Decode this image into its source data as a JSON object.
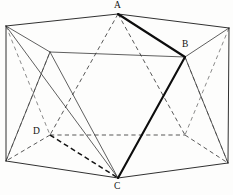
{
  "figure": {
    "canvas": {
      "width": 233,
      "height": 195
    },
    "colors": {
      "background": "#fdfdfc",
      "visible_edge": "#1a1a1a",
      "hidden_edge": "#3a3a3a",
      "highlight_edge": "#0d0d0d",
      "label_text": "#111111"
    },
    "labels": [
      {
        "id": "A",
        "text": "A",
        "x": 114,
        "y": 1
      },
      {
        "id": "B",
        "text": "B",
        "x": 182,
        "y": 40
      },
      {
        "id": "C",
        "text": "C",
        "x": 114,
        "y": 182
      },
      {
        "id": "D",
        "text": "D",
        "x": 33,
        "y": 127
      }
    ],
    "vertices": {
      "A": {
        "x": 118,
        "y": 14
      },
      "TL": {
        "x": 6,
        "y": 26
      },
      "TR": {
        "x": 229,
        "y": 28
      },
      "UL": {
        "x": 50,
        "y": 52
      },
      "B": {
        "x": 185,
        "y": 57
      },
      "UM": {
        "x": 118,
        "y": 14
      },
      "ML": {
        "x": 6,
        "y": 26
      },
      "D": {
        "x": 50,
        "y": 135
      },
      "LR": {
        "x": 185,
        "y": 135
      },
      "BL": {
        "x": 6,
        "y": 161
      },
      "BR": {
        "x": 228,
        "y": 163
      },
      "C": {
        "x": 118,
        "y": 178
      }
    },
    "edges_visible": [
      {
        "name": "A-TL",
        "x1": 118,
        "y1": 14,
        "x2": 6,
        "y2": 26
      },
      {
        "name": "A-TR",
        "x1": 118,
        "y1": 14,
        "x2": 229,
        "y2": 28
      },
      {
        "name": "TL-UL",
        "x1": 6,
        "y1": 26,
        "x2": 50,
        "y2": 52
      },
      {
        "name": "TR-B",
        "x1": 229,
        "y1": 28,
        "x2": 185,
        "y2": 57
      },
      {
        "name": "UL-B",
        "x1": 50,
        "y1": 52,
        "x2": 185,
        "y2": 57
      },
      {
        "name": "TL-BL",
        "x1": 6,
        "y1": 26,
        "x2": 6,
        "y2": 161
      },
      {
        "name": "TR-BR",
        "x1": 229,
        "y1": 28,
        "x2": 228,
        "y2": 163
      },
      {
        "name": "TL-C-ray",
        "x1": 6,
        "y1": 26,
        "x2": 118,
        "y2": 178
      },
      {
        "name": "UL-C",
        "x1": 50,
        "y1": 52,
        "x2": 118,
        "y2": 178
      },
      {
        "name": "UL-BL",
        "x1": 50,
        "y1": 52,
        "x2": 6,
        "y2": 161
      },
      {
        "name": "BL-C",
        "x1": 6,
        "y1": 161,
        "x2": 118,
        "y2": 178
      },
      {
        "name": "BR-C",
        "x1": 228,
        "y1": 163,
        "x2": 118,
        "y2": 178
      },
      {
        "name": "B-BR",
        "x1": 185,
        "y1": 57,
        "x2": 228,
        "y2": 163
      },
      {
        "name": "TR-Cx",
        "x1": 229,
        "y1": 28,
        "x2": 185,
        "y2": 135
      }
    ],
    "edges_bold": [
      {
        "name": "A-B",
        "x1": 118,
        "y1": 14,
        "x2": 185,
        "y2": 57
      },
      {
        "name": "B-C",
        "x1": 185,
        "y1": 57,
        "x2": 118,
        "y2": 178
      }
    ],
    "edges_hidden": [
      {
        "name": "A-D-dash",
        "x1": 118,
        "y1": 14,
        "x2": 50,
        "y2": 135
      },
      {
        "name": "A-LR-dash",
        "x1": 118,
        "y1": 14,
        "x2": 185,
        "y2": 135
      },
      {
        "name": "D-LR-dash",
        "x1": 50,
        "y1": 135,
        "x2": 185,
        "y2": 135
      },
      {
        "name": "D-C-dash",
        "x1": 50,
        "y1": 135,
        "x2": 118,
        "y2": 178
      },
      {
        "name": "D-BL-dash",
        "x1": 50,
        "y1": 135,
        "x2": 6,
        "y2": 161
      },
      {
        "name": "LR-BR-dash",
        "x1": 185,
        "y1": 135,
        "x2": 228,
        "y2": 163
      },
      {
        "name": "TL-D-dash",
        "x1": 6,
        "y1": 26,
        "x2": 50,
        "y2": 135
      },
      {
        "name": "TR-LRb",
        "x1": 229,
        "y1": 28,
        "x2": 185,
        "y2": 135
      },
      {
        "name": "UL-D-dash",
        "x1": 50,
        "y1": 52,
        "x2": 6,
        "y2": 161
      }
    ]
  }
}
